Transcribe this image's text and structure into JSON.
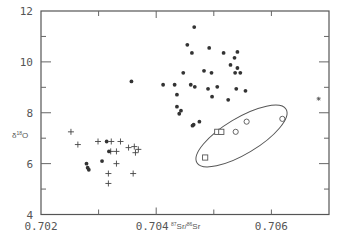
{
  "chart_data": {
    "type": "scatter",
    "title": "",
    "xlabel": "87Sr/86Sr",
    "ylabel": "δ18O",
    "xlim": [
      0.702,
      0.707
    ],
    "ylim": [
      4,
      12
    ],
    "x_ticks": [
      0.702,
      0.704,
      0.706
    ],
    "x_tick_labels": [
      "0.702",
      "0.704",
      "0.706"
    ],
    "y_ticks": [
      4,
      6,
      8,
      10,
      12
    ],
    "y_tick_labels": [
      "4",
      "6",
      "8",
      "10",
      "12"
    ],
    "grid": false,
    "legend": null,
    "series": [
      {
        "name": "plus",
        "marker": "plus",
        "points": [
          [
            0.70252,
            7.25
          ],
          [
            0.70264,
            6.75
          ],
          [
            0.70299,
            6.87
          ],
          [
            0.70322,
            6.87
          ],
          [
            0.70331,
            6.48
          ],
          [
            0.70331,
            6.0
          ],
          [
            0.70317,
            5.61
          ],
          [
            0.70317,
            5.22
          ],
          [
            0.70338,
            6.87
          ],
          [
            0.70352,
            6.63
          ],
          [
            0.70362,
            6.67
          ],
          [
            0.70369,
            6.56
          ],
          [
            0.70364,
            6.43
          ],
          [
            0.7036,
            5.61
          ],
          [
            0.70321,
            6.48
          ]
        ]
      },
      {
        "name": "dot",
        "marker": "filled-circle",
        "points": [
          [
            0.70279,
            6.0
          ],
          [
            0.70281,
            5.84
          ],
          [
            0.70283,
            5.76
          ],
          [
            0.70306,
            6.1
          ],
          [
            0.70318,
            6.48
          ],
          [
            0.70314,
            6.87
          ],
          [
            0.70357,
            9.23
          ],
          [
            0.70466,
            11.37
          ],
          [
            0.70454,
            10.67
          ],
          [
            0.70462,
            10.35
          ],
          [
            0.70447,
            9.57
          ],
          [
            0.70412,
            9.1
          ],
          [
            0.70432,
            9.1
          ],
          [
            0.7046,
            9.1
          ],
          [
            0.70467,
            9.02
          ],
          [
            0.7049,
            8.94
          ],
          [
            0.70506,
            9.02
          ],
          [
            0.70539,
            8.94
          ],
          [
            0.70555,
            8.86
          ],
          [
            0.70436,
            8.71
          ],
          [
            0.70497,
            8.63
          ],
          [
            0.70525,
            8.51
          ],
          [
            0.70436,
            8.24
          ],
          [
            0.70443,
            8.08
          ],
          [
            0.7044,
            7.96
          ],
          [
            0.70475,
            7.65
          ],
          [
            0.70465,
            7.53
          ],
          [
            0.70463,
            7.49
          ],
          [
            0.70492,
            10.55
          ],
          [
            0.70517,
            10.35
          ],
          [
            0.70541,
            10.39
          ],
          [
            0.70536,
            10.16
          ],
          [
            0.70529,
            9.88
          ],
          [
            0.70541,
            9.76
          ],
          [
            0.70483,
            9.65
          ],
          [
            0.70496,
            9.57
          ],
          [
            0.70537,
            9.57
          ],
          [
            0.70546,
            9.57
          ]
        ]
      },
      {
        "name": "circle",
        "marker": "open-circle",
        "points": [
          [
            0.70557,
            7.65
          ],
          [
            0.70538,
            7.25
          ],
          [
            0.70619,
            7.76
          ]
        ]
      },
      {
        "name": "square",
        "marker": "open-square",
        "points": [
          [
            0.70506,
            7.25
          ],
          [
            0.70513,
            7.25
          ],
          [
            0.70485,
            6.24
          ]
        ]
      },
      {
        "name": "star",
        "marker": "star",
        "points": [
          [
            0.70682,
            8.55
          ]
        ]
      }
    ],
    "annotations": [
      {
        "type": "ellipse",
        "center": [
          0.70541,
          7.0
        ],
        "note": "encloses open circles and squares"
      }
    ]
  },
  "labels": {
    "y_axis": "δ18O",
    "y_sup": "18",
    "y_pre": "δ",
    "y_post": "O",
    "x_axis_sup1": "87",
    "x_axis_mid": "Sr/",
    "x_axis_sup2": "86",
    "x_axis_end": "Sr"
  }
}
